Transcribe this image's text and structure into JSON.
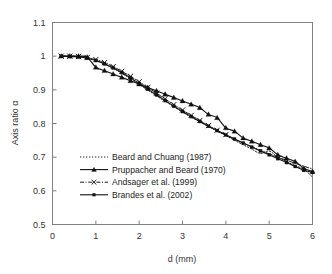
{
  "chart_data": {
    "type": "line",
    "title": "",
    "xlabel": "d (mm)",
    "ylabel": "Axis ratio α",
    "xlim": [
      0,
      6
    ],
    "ylim": [
      0.5,
      1.1
    ],
    "xticks": [
      "0",
      "1",
      "2",
      "3",
      "4",
      "5",
      "6"
    ],
    "yticks": [
      "0.5",
      "0.6",
      "0.7",
      "0.8",
      "0.9",
      "1",
      "1.1"
    ],
    "grid": false,
    "legend_position": "lower-left-inside",
    "series": [
      {
        "name": "Beard and Chuang (1987)",
        "style": "dotted",
        "marker": "none",
        "color": "#111111",
        "x": [
          0.2,
          0.4,
          0.6,
          0.8,
          1.0,
          1.2,
          1.4,
          1.6,
          1.8,
          2.0,
          2.2,
          2.4,
          2.6,
          2.8,
          3.0,
          3.2,
          3.4,
          3.6,
          3.8,
          4.0,
          4.2,
          4.4,
          4.6,
          4.8,
          5.0,
          5.2,
          5.4,
          5.6,
          5.8,
          6.0
        ],
        "y": [
          1.0,
          1.0,
          0.999,
          0.995,
          0.988,
          0.977,
          0.964,
          0.949,
          0.933,
          0.916,
          0.899,
          0.882,
          0.866,
          0.85,
          0.834,
          0.819,
          0.805,
          0.791,
          0.777,
          0.764,
          0.75,
          0.737,
          0.724,
          0.711,
          0.718,
          0.7,
          0.687,
          0.675,
          0.664,
          0.641
        ]
      },
      {
        "name": "Pruppacher and Beard (1970)",
        "style": "solid",
        "marker": "triangle",
        "color": "#111111",
        "x": [
          0.2,
          0.4,
          0.6,
          0.8,
          1.0,
          1.2,
          1.4,
          1.6,
          1.8,
          2.0,
          2.2,
          2.4,
          2.6,
          2.8,
          3.0,
          3.2,
          3.4,
          3.6,
          3.8,
          4.0,
          4.2,
          4.4,
          4.6,
          4.8,
          5.0,
          5.2,
          5.4,
          5.6,
          5.8,
          6.0
        ],
        "y": [
          1.0,
          1.0,
          1.0,
          0.997,
          0.967,
          0.957,
          0.947,
          0.937,
          0.927,
          0.917,
          0.907,
          0.897,
          0.887,
          0.877,
          0.867,
          0.857,
          0.847,
          0.827,
          0.817,
          0.787,
          0.777,
          0.757,
          0.747,
          0.737,
          0.727,
          0.707,
          0.697,
          0.687,
          0.667,
          0.657
        ]
      },
      {
        "name": "Andsager et al. (1999)",
        "style": "dashdot",
        "marker": "cross",
        "color": "#111111",
        "x": [
          0.2,
          0.4,
          0.6,
          0.8,
          1.0,
          1.2,
          1.4,
          1.6,
          1.8,
          2.0,
          2.2,
          2.4,
          2.6,
          2.8,
          3.0,
          3.2,
          3.4,
          3.6,
          3.8,
          4.0,
          4.2,
          4.4,
          4.6,
          4.8,
          5.0,
          5.2,
          5.4,
          5.6,
          5.8,
          6.0
        ],
        "y": [
          1.0,
          1.0,
          0.999,
          0.996,
          0.99,
          0.981,
          0.969,
          0.955,
          0.94,
          0.924,
          0.907,
          0.89,
          0.873,
          0.856,
          0.84,
          0.824,
          0.809,
          0.794,
          0.78,
          0.767,
          0.754,
          0.742,
          0.731,
          0.72,
          0.71,
          0.7,
          0.691,
          0.682,
          0.673,
          0.665
        ]
      },
      {
        "name": "Brandes et al. (2002)",
        "style": "solid",
        "marker": "square",
        "color": "#111111",
        "x": [
          0.2,
          0.4,
          0.6,
          0.8,
          1.0,
          1.2,
          1.4,
          1.6,
          1.8,
          2.0,
          2.2,
          2.4,
          2.6,
          2.8,
          3.0,
          3.2,
          3.4,
          3.6,
          3.8,
          4.0,
          4.2,
          4.4,
          4.6,
          4.8,
          5.0,
          5.2,
          5.4,
          5.6,
          5.8,
          6.0
        ],
        "y": [
          0.9995,
          0.999,
          0.9975,
          0.994,
          0.987,
          0.977,
          0.965,
          0.951,
          0.9355,
          0.919,
          0.902,
          0.885,
          0.868,
          0.8515,
          0.8355,
          0.8205,
          0.806,
          0.792,
          0.779,
          0.766,
          0.754,
          0.742,
          0.73,
          0.7185,
          0.707,
          0.6955,
          0.684,
          0.6725,
          0.661,
          0.655
        ]
      }
    ]
  },
  "legend": {
    "entries": [
      {
        "label": "Beard and Chuang (1987)",
        "style": "dotted",
        "marker": "none"
      },
      {
        "label": "Pruppacher and Beard (1970)",
        "style": "solid",
        "marker": "triangle"
      },
      {
        "label": "Andsager et al. (1999)",
        "style": "dashdot",
        "marker": "cross"
      },
      {
        "label": "Brandes et al. (2002)",
        "style": "solid",
        "marker": "square"
      }
    ]
  },
  "colors": {
    "frame": "#808080",
    "text": "#333333",
    "series": "#111111",
    "background": "#ffffff"
  }
}
